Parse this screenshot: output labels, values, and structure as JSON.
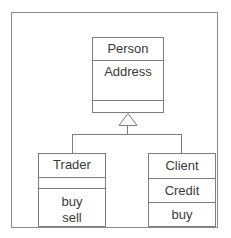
{
  "diagram": {
    "type": "uml-class-diagram",
    "title": "",
    "colors": {
      "frame_border": "#8a8a8a",
      "box_border": "#7d7d7d",
      "text": "#3a3a3a",
      "background": "#ffffff",
      "connector": "#7d7d7d"
    },
    "classes": [
      {
        "id": "person",
        "name": "Person",
        "attributes": [
          "Address"
        ],
        "operations": []
      },
      {
        "id": "trader",
        "name": "Trader",
        "attributes": [],
        "operations": [
          "buy",
          "sell"
        ]
      },
      {
        "id": "client",
        "name": "Client",
        "attributes": [
          "Credit"
        ],
        "operations": [
          "buy"
        ]
      }
    ],
    "relationships": [
      {
        "kind": "generalization",
        "label": "",
        "from": "Trader",
        "to": "Person",
        "arrowhead": "hollow-triangle"
      },
      {
        "kind": "generalization",
        "label": "",
        "from": "Client",
        "to": "Person",
        "arrowhead": "hollow-triangle"
      }
    ]
  }
}
